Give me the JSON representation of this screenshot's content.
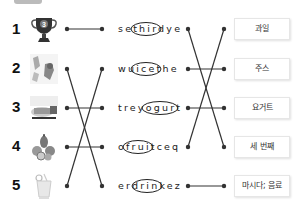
{
  "exercise": {
    "rows": [
      {
        "number": "1",
        "image": "trophy-icon",
        "word": "sethirdye",
        "answer": "third",
        "meaning": "과일"
      },
      {
        "number": "2",
        "image": "juice-icon",
        "word": "wuicethe",
        "answer": "juice",
        "meaning": "주스"
      },
      {
        "number": "3",
        "image": "yogurt-icon",
        "word": "treyogurt",
        "answer": "yogurt",
        "meaning": "요거트"
      },
      {
        "number": "4",
        "image": "fruit-icon",
        "word": "ofruitceq",
        "answer": "fruit",
        "meaning": "세 번째"
      },
      {
        "number": "5",
        "image": "drink-icon",
        "word": "erdrinkez",
        "answer": "drink",
        "meaning": "마시다; 음료"
      }
    ],
    "left_connections": [
      [
        1,
        1
      ],
      [
        2,
        5
      ],
      [
        3,
        3
      ],
      [
        4,
        4
      ],
      [
        5,
        2
      ]
    ],
    "right_connections": [
      [
        1,
        4
      ],
      [
        2,
        2
      ],
      [
        3,
        3
      ],
      [
        4,
        1
      ],
      [
        5,
        5
      ]
    ],
    "colors": {
      "line": "#333333",
      "ellipse": "#222222",
      "box_border": "#e6e6e6"
    }
  }
}
